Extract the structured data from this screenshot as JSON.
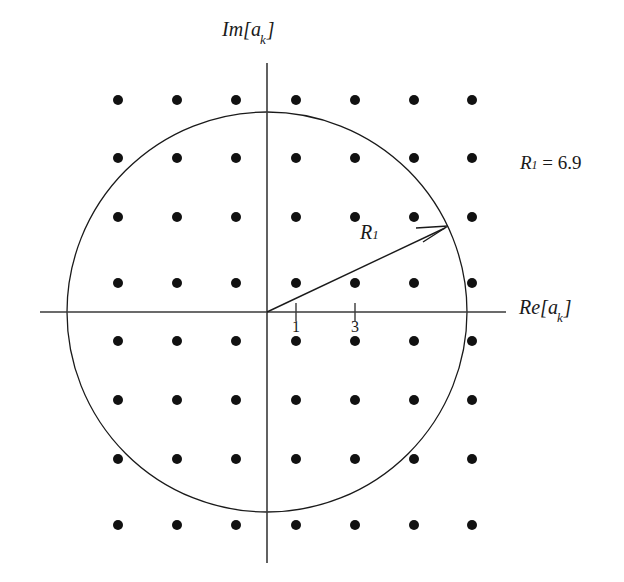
{
  "figure": {
    "type": "constellation-diagram",
    "axes": {
      "imaginary_label": "Im[a",
      "imaginary_sub": "k",
      "imaginary_close": "]",
      "real_label": "Re[a",
      "real_sub": "k",
      "real_close": "]",
      "origin": {
        "x": 267,
        "y": 312
      }
    },
    "ticks": [
      {
        "label": "1",
        "x": 296,
        "axis": "real"
      },
      {
        "label": "3",
        "x": 355,
        "axis": "real"
      }
    ],
    "annotations": {
      "radius_arrow_label": "R",
      "radius_arrow_sub": "1",
      "radius_value_symbol": "R",
      "radius_value_sub": "1",
      "radius_value_eq": " = 6.9",
      "radius_value_full": "R1 = 6.9"
    },
    "circle": {
      "center_x": 267,
      "center_y": 312,
      "radius": 200,
      "stroke": "#1a1a1a"
    },
    "arrow": {
      "from_x": 267,
      "from_y": 312,
      "to_x": 448,
      "to_y": 226
    },
    "colors": {
      "ink": "#1a1a1a",
      "background": "#ffffff",
      "dot": "#111111"
    },
    "grid": {
      "columns_x": [
        118,
        177,
        236,
        296,
        355,
        414,
        472
      ],
      "rows_y": [
        100,
        158,
        217,
        283,
        341,
        400,
        459,
        525
      ],
      "dot_radius": 5,
      "spacing": 59
    }
  }
}
